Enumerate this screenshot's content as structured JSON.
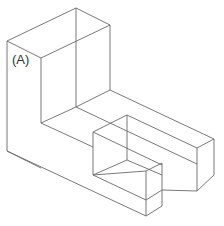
{
  "diagram": {
    "type": "isometric-wireframe",
    "label": "(A)",
    "label_position": {
      "x": 12,
      "y": 52
    },
    "stroke_color": "#6a6a6a",
    "background": "#ffffff",
    "edges": [
      [
        7,
        41,
        76,
        8
      ],
      [
        76,
        8,
        110,
        25
      ],
      [
        110,
        25,
        41,
        58
      ],
      [
        41,
        58,
        7,
        41
      ],
      [
        7,
        41,
        7,
        151
      ],
      [
        41,
        58,
        41,
        123
      ],
      [
        110,
        25,
        110,
        90
      ],
      [
        76,
        8,
        76,
        107
      ],
      [
        41,
        123,
        76,
        107
      ],
      [
        76,
        107,
        110,
        90
      ],
      [
        110,
        90,
        214,
        139
      ],
      [
        76,
        107,
        197,
        164
      ],
      [
        7,
        151,
        146,
        216
      ],
      [
        127,
        115,
        197,
        148
      ],
      [
        127,
        115,
        93,
        132
      ],
      [
        127,
        115,
        127,
        160
      ],
      [
        197,
        148,
        214,
        139
      ],
      [
        214,
        139,
        214,
        175
      ],
      [
        197,
        148,
        197,
        191
      ],
      [
        214,
        175,
        197,
        191
      ],
      [
        93,
        132,
        93,
        175
      ],
      [
        93,
        132,
        162,
        165
      ],
      [
        93,
        175,
        146,
        200
      ],
      [
        146,
        200,
        162,
        190
      ],
      [
        162,
        163,
        162,
        206
      ],
      [
        146,
        171,
        146,
        216
      ],
      [
        146,
        216,
        162,
        206
      ],
      [
        93,
        175,
        127,
        160
      ],
      [
        127,
        160,
        162,
        175
      ],
      [
        146,
        171,
        162,
        163
      ],
      [
        93,
        175,
        146,
        171
      ],
      [
        162,
        190,
        197,
        191
      ],
      [
        41,
        123,
        93,
        147
      ],
      [
        7,
        151,
        41,
        168
      ]
    ]
  }
}
